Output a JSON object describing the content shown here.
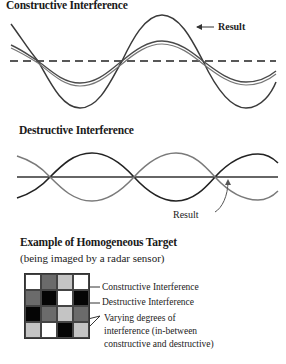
{
  "constructive": {
    "title": "Constructive Interference",
    "result_label": "Result"
  },
  "destructive": {
    "title": "Destructive Interference",
    "result_label": "Result"
  },
  "homogeneous": {
    "title": "Example of Homogeneous Target",
    "subtitle": "(being imaged by a radar sensor)",
    "labels": {
      "constructive": "Constructive Interference",
      "destructive": "Destructive Interference",
      "varying_line1": "Varying degrees of",
      "varying_line2": "interference (in-between",
      "varying_line3": "constructive and destructive)"
    },
    "grid": [
      [
        "#ffffff",
        "#6b6b6b",
        "#c4c4c4",
        "#ffffff"
      ],
      [
        "#6b6b6b",
        "#050505",
        "#ffffff",
        "#050505"
      ],
      [
        "#050505",
        "#6b6b6b",
        "#c4c4c4",
        "#6b6b6b"
      ],
      [
        "#c4c4c4",
        "#ffffff",
        "#050505",
        "#c4c4c4"
      ]
    ]
  },
  "colors": {
    "result_wave": "#333333",
    "component_wave": "#555555",
    "light_wave": "#8a8a8a",
    "axis": "#222222"
  }
}
